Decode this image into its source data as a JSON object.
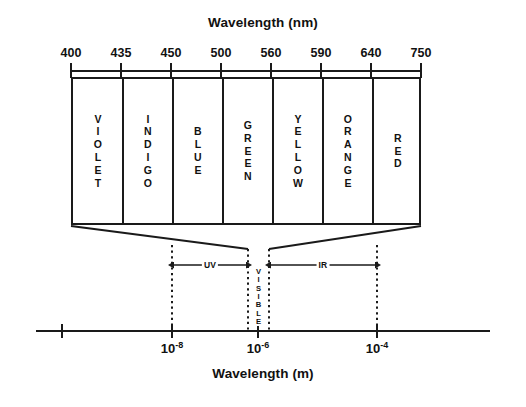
{
  "figure": {
    "title_top": "Wavelength (nm)",
    "title_bottom": "Wavelength (m)"
  },
  "chart_data": {
    "type": "diagram",
    "title": "Wavelength (nm)",
    "xlabel": "Wavelength (m)",
    "top_axis": {
      "label": "Wavelength (nm)",
      "unit": "nm",
      "tick_labels": [
        "400",
        "435",
        "450",
        "500",
        "560",
        "590",
        "640",
        "750"
      ],
      "tick_values": [
        400,
        435,
        450,
        500,
        560,
        590,
        640,
        750
      ],
      "spacing": "equal-interval (non-linear)"
    },
    "bands": [
      {
        "name": "VIOLET",
        "stacked": "V\nI\nO\nL\nE\nT",
        "from_nm": 400,
        "to_nm": 435
      },
      {
        "name": "INDIGO",
        "stacked": "I\nN\nD\nI\nG\nO",
        "from_nm": 435,
        "to_nm": 450
      },
      {
        "name": "BLUE",
        "stacked": "B\nL\nU\nE",
        "from_nm": 450,
        "to_nm": 500
      },
      {
        "name": "GREEN",
        "stacked": "G\nR\nE\nE\nN",
        "from_nm": 500,
        "to_nm": 560
      },
      {
        "name": "YELLOW",
        "stacked": "Y\nE\nL\nL\nO\nW",
        "from_nm": 560,
        "to_nm": 590
      },
      {
        "name": "ORANGE",
        "stacked": "O\nR\nA\nN\nG\nE",
        "from_nm": 590,
        "to_nm": 640
      },
      {
        "name": "RED",
        "stacked": "R\nE\nD",
        "from_nm": 640,
        "to_nm": 750
      }
    ],
    "bottom_axis": {
      "label": "Wavelength (m)",
      "unit": "m",
      "tick_labels": [
        "10-8",
        "10-6",
        "10-4"
      ],
      "tick_mantissa": "10",
      "tick_exponents": [
        "-8",
        "-6",
        "-4"
      ],
      "tick_values": [
        1e-08,
        1e-06,
        0.0001
      ],
      "has_unlabeled_left_tick": true
    },
    "regions": [
      {
        "name": "UV",
        "label": "UV",
        "arrow": "double-headed",
        "from": "10^-8",
        "to": "visible"
      },
      {
        "name": "VISIBLE",
        "label": "VISIBLE",
        "stacked": "V\nI\nS\nI\nB\nL\nE",
        "orientation": "vertical"
      },
      {
        "name": "IR",
        "label": "IR",
        "arrow": "double-headed",
        "from": "visible",
        "to": "10^-4"
      }
    ]
  },
  "colors": {
    "ink": "#1a1a1a",
    "background": "#ffffff"
  }
}
